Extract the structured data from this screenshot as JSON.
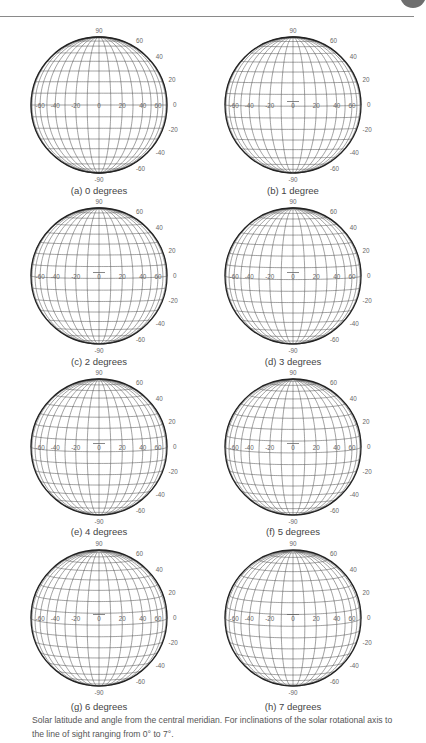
{
  "figure": {
    "caption": "Solar latitude and angle from the central meridian. For inclinations of the solar rotational axis to the line of sight ranging from 0° to 7°.",
    "grid": {
      "meridian_step_deg": 10,
      "parallel_step_deg": 10,
      "equator_labels": [
        "-60",
        "-40",
        "-20",
        "0",
        "20",
        "40",
        "60"
      ],
      "latitude_labels_right": [
        "60",
        "40",
        "20",
        "0",
        "-20",
        "-40",
        "-60"
      ],
      "pole_top_label": "90",
      "pole_bottom_label": "-90"
    },
    "panels": [
      {
        "id": "a",
        "caption": "(a) 0 degrees",
        "inclination_deg": 0
      },
      {
        "id": "b",
        "caption": "(b) 1 degree",
        "inclination_deg": 1
      },
      {
        "id": "c",
        "caption": "(c) 2 degrees",
        "inclination_deg": 2
      },
      {
        "id": "d",
        "caption": "(d) 3 degrees",
        "inclination_deg": 3
      },
      {
        "id": "e",
        "caption": "(e) 4 degrees",
        "inclination_deg": 4
      },
      {
        "id": "f",
        "caption": "(f) 5 degrees",
        "inclination_deg": 5
      },
      {
        "id": "g",
        "caption": "(g) 6 degrees",
        "inclination_deg": 6
      },
      {
        "id": "h",
        "caption": "(h) 7 degrees",
        "inclination_deg": 7
      }
    ]
  },
  "colors": {
    "grid_line": "#555555",
    "limb": "#222222",
    "label": "#666666",
    "rule": "#8a8a8a"
  }
}
